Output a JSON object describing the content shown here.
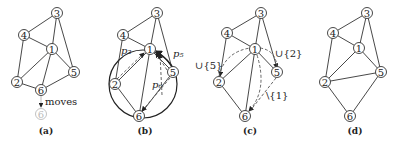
{
  "panels": [
    {
      "id": "a",
      "caption": "(a)",
      "annotation": "moves",
      "ghost_node": "6"
    },
    {
      "id": "b",
      "caption": "(b)",
      "labels": {
        "p2": "p₂",
        "p5": "p₅",
        "p6": "p₆"
      }
    },
    {
      "id": "c",
      "caption": "(c)",
      "labels": {
        "union5": "∪{5}",
        "union2": "∪{2}",
        "minus1": "\\{1}"
      }
    },
    {
      "id": "d",
      "caption": "(d)"
    }
  ],
  "nodes": [
    "1",
    "2",
    "3",
    "4",
    "5",
    "6"
  ]
}
